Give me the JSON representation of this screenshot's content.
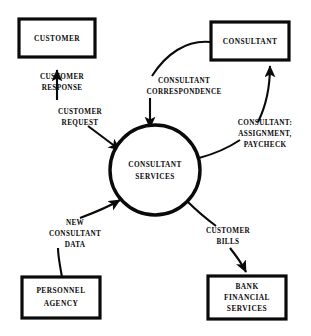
{
  "diagram": {
    "type": "data-flow-diagram",
    "colors": {
      "background": "#ffffff",
      "stroke": "#0a0a0a",
      "fill": "#ffffff"
    },
    "process": {
      "id": "consultant-services",
      "shape": "circle",
      "lines": [
        "CONSULTANT",
        "SERVICES"
      ],
      "cx": 155,
      "cy": 170,
      "r": 45
    },
    "entities": [
      {
        "id": "customer",
        "shape": "rectangle",
        "lines": [
          "CUSTOMER"
        ],
        "x": 19,
        "y": 19,
        "w": 76,
        "h": 38
      },
      {
        "id": "consultant",
        "shape": "rectangle",
        "lines": [
          "CONSULTANT"
        ],
        "x": 211,
        "y": 22,
        "w": 78,
        "h": 38
      },
      {
        "id": "personnel-agency",
        "shape": "rectangle",
        "lines": [
          "PERSONNEL",
          "AGENCY"
        ],
        "x": 22,
        "y": 277,
        "w": 78,
        "h": 41
      },
      {
        "id": "bank-financial-services",
        "shape": "rectangle",
        "lines": [
          "BANK",
          "FINANCIAL",
          "SERVICES"
        ],
        "x": 208,
        "y": 276,
        "w": 78,
        "h": 43
      }
    ],
    "flows": [
      {
        "id": "customer-response",
        "lines": [
          "CUSTOMER",
          "RESPONSE"
        ],
        "from": "consultant-services",
        "to": "customer",
        "label_x": 62,
        "label_y": 81
      },
      {
        "id": "customer-request",
        "lines": [
          "CUSTOMER",
          "REQUEST"
        ],
        "from": "customer",
        "to": "consultant-services",
        "label_x": 80,
        "label_y": 116
      },
      {
        "id": "consultant-correspondence",
        "lines": [
          "CONSULTANT",
          "CORRESPONDENCE"
        ],
        "from": "consultant",
        "to": "consultant-services",
        "label_x": 184,
        "label_y": 84
      },
      {
        "id": "consultant-assignment-paycheck",
        "lines": [
          "CONSULTANT:",
          "ASSIGNMENT,",
          "PAYCHECK"
        ],
        "from": "consultant-services",
        "to": "consultant",
        "label_x": 265,
        "label_y": 130
      },
      {
        "id": "new-consultant-data",
        "lines": [
          "NEW",
          "CONSULTANT",
          "DATA"
        ],
        "from": "personnel-agency",
        "to": "consultant-services",
        "label_x": 75,
        "label_y": 227
      },
      {
        "id": "customer-bills",
        "lines": [
          "CUSTOMER",
          "BILLS"
        ],
        "from": "consultant-services",
        "to": "bank-financial-services",
        "label_x": 228,
        "label_y": 234
      }
    ]
  }
}
